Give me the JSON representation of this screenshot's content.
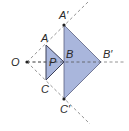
{
  "diagram": {
    "type": "geometric-enlargement",
    "center_label": "O",
    "small_triangle": {
      "name": "P",
      "vertices": [
        "A",
        "B",
        "C"
      ]
    },
    "large_triangle": {
      "vertices": [
        "A′",
        "B′",
        "C′"
      ]
    },
    "labels": {
      "O": "O",
      "A": "A",
      "B": "B",
      "C": "C",
      "P": "P",
      "A_prime": "A′",
      "B_prime": "B′",
      "C_prime": "C′"
    },
    "colors": {
      "fill": "#a9b6dc",
      "stroke": "#4a4f6a",
      "dashed": "#777777",
      "point": "#222222"
    }
  }
}
